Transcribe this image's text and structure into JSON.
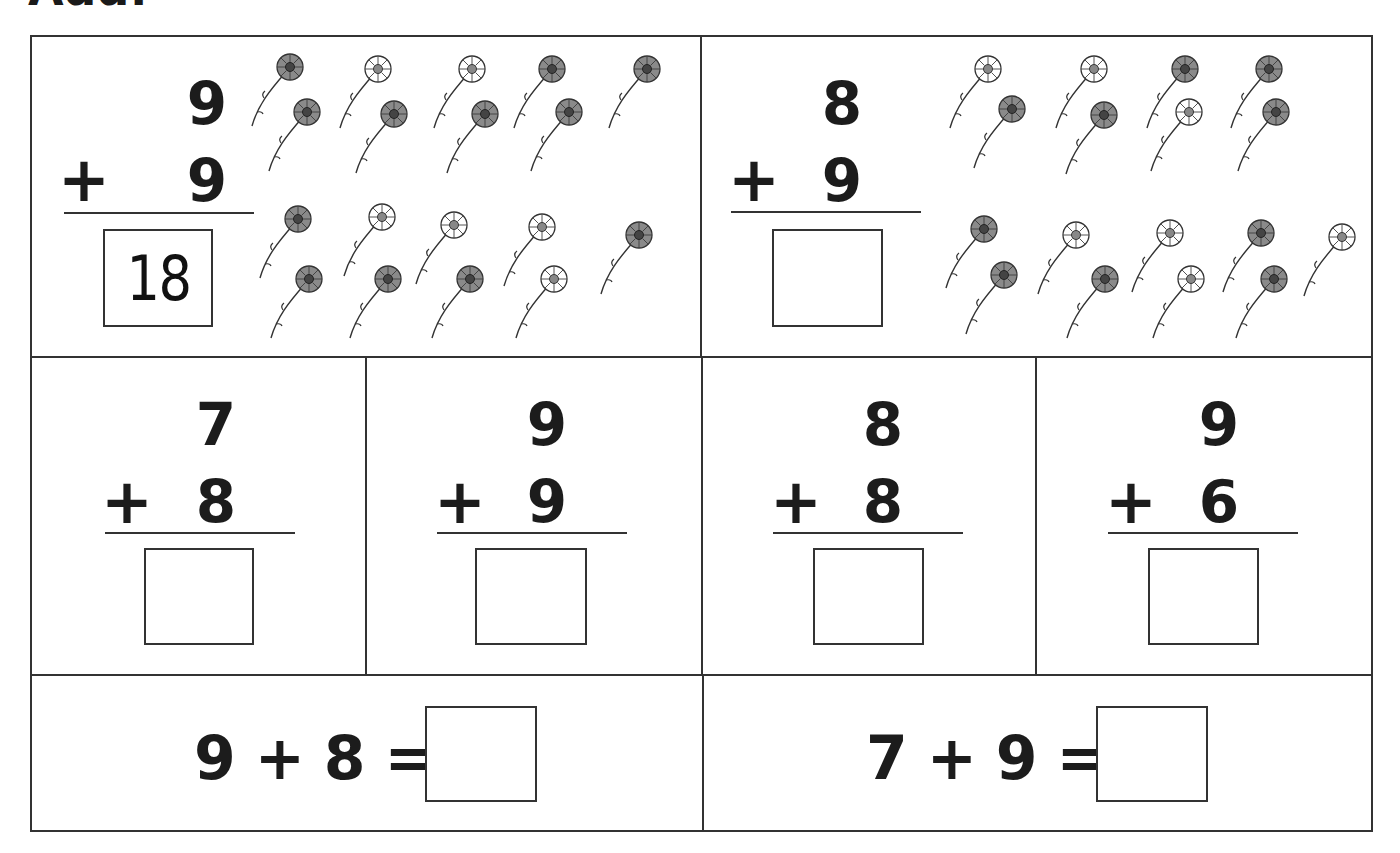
{
  "title": "Add:",
  "problems_with_pictures": [
    {
      "top": "9",
      "operator": "+",
      "bottom": "9",
      "answer": "18",
      "flowers_top_count": 9,
      "flowers_bottom_count": 9
    },
    {
      "top": "8",
      "operator": "+",
      "bottom": "9",
      "answer": "",
      "flowers_top_count": 8,
      "flowers_bottom_count": 9
    }
  ],
  "vertical_problems": [
    {
      "top": "7",
      "operator": "+",
      "bottom": "8",
      "answer": ""
    },
    {
      "top": "9",
      "operator": "+",
      "bottom": "9",
      "answer": ""
    },
    {
      "top": "8",
      "operator": "+",
      "bottom": "8",
      "answer": ""
    },
    {
      "top": "9",
      "operator": "+",
      "bottom": "6",
      "answer": ""
    }
  ],
  "horizontal_problems": [
    {
      "expression": "9 + 8 =",
      "answer": ""
    },
    {
      "expression": "7 + 9 =",
      "answer": ""
    }
  ],
  "colors": {
    "ink": "#1c1c1c",
    "lines": "#333333",
    "paper": "#ffffff"
  }
}
